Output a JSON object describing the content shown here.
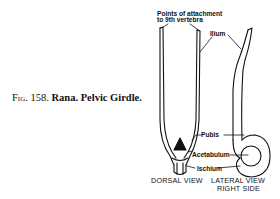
{
  "caption": {
    "fig": "Fig. 158.",
    "genus": "Rana.",
    "subject": "Pelvic Girdle."
  },
  "labels": {
    "attachment_line1": "Points of attachment",
    "attachment_line2": "to 9th vertebra",
    "ilium": "Ilium",
    "pubis": "Pubis",
    "acetabulum": "Acetabulum",
    "ischium": "Ischium"
  },
  "views": {
    "dorsal": "DORSAL VIEW",
    "lateral_line1": "LATERAL VIEW",
    "lateral_line2": "RIGHT SIDE"
  }
}
